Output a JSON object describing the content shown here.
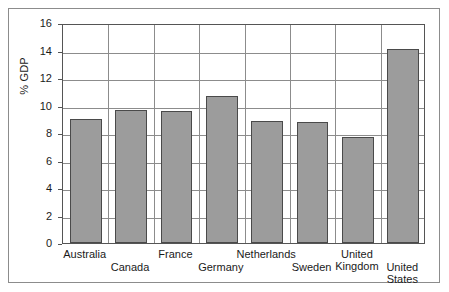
{
  "chart_data": {
    "type": "bar",
    "title": "",
    "xlabel": "",
    "ylabel": "% GDP",
    "ylim": [
      0,
      16
    ],
    "yticks": [
      0,
      2,
      4,
      6,
      8,
      10,
      12,
      14,
      16
    ],
    "ytick_labels": [
      "0",
      "2",
      "4",
      "6",
      "8",
      "10",
      "12",
      "14",
      "16"
    ],
    "grid": true,
    "legend": "none",
    "bar_color": "#9c9c9c",
    "bar_edge_color": "#4a4a4a",
    "categories": [
      "Australia",
      "Canada",
      "France",
      "Germany",
      "Netherlands",
      "Sweden",
      "United Kingdom",
      "United States"
    ],
    "category_lines": [
      [
        "Australia"
      ],
      [
        "Canada"
      ],
      [
        "France"
      ],
      [
        "Germany"
      ],
      [
        "Netherlands"
      ],
      [
        "Sweden"
      ],
      [
        "United",
        "Kingdom"
      ],
      [
        "United",
        "States"
      ]
    ],
    "values": [
      9.0,
      9.7,
      9.6,
      10.7,
      8.9,
      8.8,
      7.7,
      14.1
    ]
  }
}
